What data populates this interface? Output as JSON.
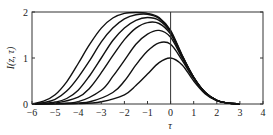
{
  "chart_data": {
    "type": "line",
    "title": "",
    "xlabel": "τ",
    "ylabel": "I(z, τ)",
    "xlim": [
      -6,
      4
    ],
    "ylim": [
      0,
      2
    ],
    "xticks": [
      -6,
      -5,
      -4,
      -3,
      -2,
      -1,
      0,
      1,
      2,
      3,
      4
    ],
    "yticks": [
      0,
      1,
      2
    ],
    "grid": false,
    "legend": null,
    "annotations": [
      "vertical line at τ = 0"
    ],
    "series": [
      {
        "name": "curve-1",
        "x": [
          -6,
          -4,
          -3,
          -2,
          -1.5,
          -1,
          -0.5,
          0,
          0.5,
          1,
          1.5,
          2,
          2.5,
          3
        ],
        "y": [
          0,
          0.01,
          0.05,
          0.2,
          0.4,
          0.65,
          0.9,
          1.0,
          0.85,
          0.5,
          0.22,
          0.07,
          0.02,
          0
        ]
      },
      {
        "name": "curve-2",
        "x": [
          -6,
          -4.5,
          -3.5,
          -2.5,
          -2,
          -1.5,
          -1,
          -0.5,
          0,
          0.5,
          1,
          1.5,
          2,
          2.5,
          3
        ],
        "y": [
          0,
          0.01,
          0.05,
          0.25,
          0.5,
          0.85,
          1.15,
          1.33,
          1.3,
          0.95,
          0.55,
          0.24,
          0.08,
          0.02,
          0
        ]
      },
      {
        "name": "curve-3",
        "x": [
          -6,
          -5,
          -4,
          -3,
          -2.5,
          -2,
          -1.5,
          -1,
          -0.5,
          0,
          0.5,
          1,
          1.5,
          2,
          2.5,
          3
        ],
        "y": [
          0,
          0.01,
          0.05,
          0.3,
          0.6,
          0.95,
          1.3,
          1.52,
          1.6,
          1.45,
          1.0,
          0.57,
          0.25,
          0.08,
          0.02,
          0
        ]
      },
      {
        "name": "curve-4",
        "x": [
          -6,
          -5,
          -4,
          -3.5,
          -3,
          -2.5,
          -2,
          -1.5,
          -1,
          -0.5,
          0,
          0.5,
          1,
          1.5,
          2,
          2.5,
          3
        ],
        "y": [
          0,
          0.02,
          0.15,
          0.35,
          0.68,
          1.05,
          1.4,
          1.65,
          1.77,
          1.75,
          1.52,
          1.03,
          0.58,
          0.25,
          0.08,
          0.02,
          0
        ]
      },
      {
        "name": "curve-5",
        "x": [
          -6,
          -5,
          -4.5,
          -4,
          -3.5,
          -3,
          -2.5,
          -2,
          -1.5,
          -1,
          -0.5,
          0,
          0.5,
          1,
          1.5,
          2,
          2.5,
          3
        ],
        "y": [
          0,
          0.04,
          0.12,
          0.3,
          0.62,
          1.0,
          1.38,
          1.65,
          1.82,
          1.88,
          1.82,
          1.56,
          1.04,
          0.58,
          0.25,
          0.08,
          0.02,
          0
        ]
      },
      {
        "name": "curve-6",
        "x": [
          -6,
          -5.5,
          -5,
          -4.5,
          -4,
          -3.5,
          -3,
          -2.5,
          -2,
          -1.5,
          -1,
          -0.5,
          0,
          0.5,
          1,
          1.5,
          2,
          2.5,
          3
        ],
        "y": [
          0,
          0.03,
          0.1,
          0.28,
          0.58,
          0.95,
          1.35,
          1.65,
          1.85,
          1.94,
          1.95,
          1.86,
          1.58,
          1.05,
          0.58,
          0.25,
          0.08,
          0.02,
          0
        ]
      },
      {
        "name": "curve-7",
        "x": [
          -6,
          -5.5,
          -5,
          -4.5,
          -4,
          -3.5,
          -3,
          -2.5,
          -2,
          -1.5,
          -1,
          -0.5,
          0,
          0.5,
          1,
          1.5,
          2,
          2.5,
          3
        ],
        "y": [
          0,
          0.06,
          0.2,
          0.48,
          0.88,
          1.3,
          1.65,
          1.87,
          1.97,
          1.99,
          1.97,
          1.88,
          1.6,
          1.06,
          0.58,
          0.25,
          0.08,
          0.02,
          0
        ]
      }
    ]
  }
}
